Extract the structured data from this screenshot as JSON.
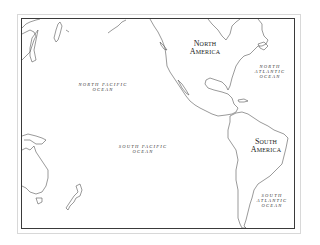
{
  "map": {
    "type": "outline-map",
    "region": "Pacific Ocean and the Americas",
    "frame_color": "#3a3a3a",
    "land_stroke_color": "#555555",
    "labels": {
      "north_america": {
        "line1": "North",
        "line2": "America"
      },
      "south_america": {
        "line1": "South",
        "line2": "America"
      },
      "north_pacific": {
        "line1": "NORTH PACIFIC",
        "line2": "OCEAN"
      },
      "south_pacific": {
        "line1": "SOUTH PACIFIC",
        "line2": "OCEAN"
      },
      "north_atlantic": {
        "line1": "NORTH",
        "line2": "ATLANTIC",
        "line3": "OCEAN"
      },
      "south_atlantic": {
        "line1": "SOUTH",
        "line2": "ATLANTIC",
        "line3": "OCEAN"
      }
    }
  }
}
